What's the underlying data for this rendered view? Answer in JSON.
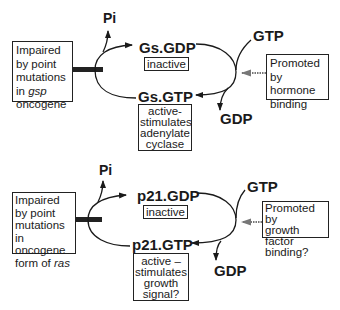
{
  "top_panel": {
    "pi_label": "Pi",
    "gdp_state_label": "Gs.GDP",
    "gdp_state_badge": "inactive",
    "gtp_state_label": "Gs.GTP",
    "gtp_in_label": "GTP",
    "gdp_out_label": "GDP",
    "impaired_box": {
      "lines": [
        "Impaired",
        "by point",
        "mutations"
      ],
      "line4_prefix": "in ",
      "line4_italic": "gsp",
      "line5": "oncogene"
    },
    "promoted_box": {
      "lines": [
        "Promoted",
        "by hormone",
        "binding"
      ]
    },
    "active_box": {
      "lines": [
        "active-",
        "stimulates",
        "adenylate",
        "cyclase"
      ]
    }
  },
  "bottom_panel": {
    "pi_label": "Pi",
    "gdp_state_label": "p21.GDP",
    "gdp_state_badge": "inactive",
    "gtp_state_label": "p21.GTP",
    "gtp_in_label": "GTP",
    "gdp_out_label": "GDP",
    "impaired_box": {
      "lines": [
        "Impaired",
        "by point",
        "mutations",
        "in oncogene"
      ],
      "line5_prefix": "form of ",
      "line5_italic": "ras"
    },
    "promoted_box": {
      "lines": [
        "Promoted by",
        "growth factor",
        "binding?"
      ]
    },
    "active_box": {
      "lines": [
        "active –",
        "stimulates",
        "growth",
        "signal?"
      ]
    }
  },
  "colors": {
    "ink": "#1a1a1a",
    "background": "#ffffff",
    "hatched_arrow": "#777777"
  }
}
